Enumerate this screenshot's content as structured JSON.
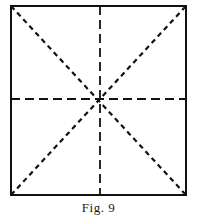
{
  "figure": {
    "caption": "Fig. 9",
    "square": {
      "x1": 11,
      "y1": 6,
      "x2": 186,
      "y2": 195
    },
    "stroke_color": "#111111",
    "background": "#ffffff",
    "lines": {
      "border": "solid",
      "vertical_center": "long-dash",
      "horizontal_center": "long-dash",
      "diagonal_tl_br": "short-dash",
      "diagonal_bl_tr": "short-dash"
    }
  }
}
